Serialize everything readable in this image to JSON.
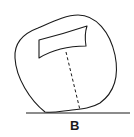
{
  "diagram": {
    "label": "B",
    "stroke_color": "#1a1a1a",
    "background": "#ffffff",
    "elements": [
      {
        "id": "outer-body",
        "kind": "irregular-rounded-outline"
      },
      {
        "id": "inner-window",
        "kind": "curved-quadrilateral"
      },
      {
        "id": "dashed-line",
        "kind": "dashed-vertical-line",
        "from": "inner-window",
        "to": "ground-line"
      },
      {
        "id": "ground-line",
        "kind": "horizontal-line"
      }
    ]
  }
}
